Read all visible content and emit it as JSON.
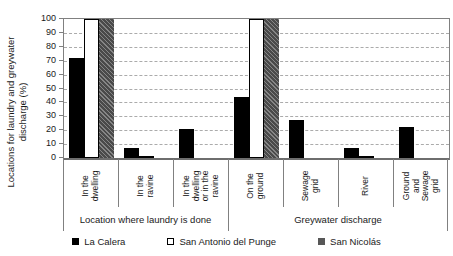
{
  "chart_data": {
    "type": "bar",
    "title": "",
    "ylabel": "Locations for laundry and greywater discharge (%)",
    "ylabel_lines": [
      "Locations for laundry and greywater",
      "discharge (%)"
    ],
    "ylim": [
      0,
      100
    ],
    "yticks": [
      0,
      10,
      20,
      30,
      40,
      50,
      60,
      70,
      80,
      90,
      100
    ],
    "grid": "horizontal-dashed",
    "legend_position": "bottom",
    "categories": [
      "In the dwelling",
      "In the ravine",
      "In the dwelling or in the ravine",
      "On the ground",
      "Sewage grid",
      "River",
      "Ground and Sewage grid"
    ],
    "category_label_lines": [
      [
        "In the",
        "dwelling"
      ],
      [
        "In the",
        "ravine"
      ],
      [
        "In the",
        "dwelling",
        "or in the",
        "ravine"
      ],
      [
        "On the",
        "ground"
      ],
      [
        "Sewage",
        "grid"
      ],
      [
        "River"
      ],
      [
        "Ground",
        "and",
        "Sewage",
        "grid"
      ]
    ],
    "groups": [
      {
        "label": "Location where laundry is done",
        "category_count": 3
      },
      {
        "label": "Greywater discharge",
        "category_count": 4
      }
    ],
    "series": [
      {
        "name": "La Calera",
        "style": "solid",
        "color": "#000000",
        "values": [
          72,
          7,
          21,
          44,
          27,
          7,
          22
        ]
      },
      {
        "name": "San Antonio del Punge",
        "style": "outlined",
        "color": "#ffffff",
        "values": [
          100,
          1,
          0,
          100,
          0,
          1,
          0
        ]
      },
      {
        "name": "San Nicolás",
        "style": "hatched",
        "color": "#575757",
        "values": [
          100,
          0,
          0,
          100,
          0,
          0,
          0
        ]
      }
    ]
  }
}
